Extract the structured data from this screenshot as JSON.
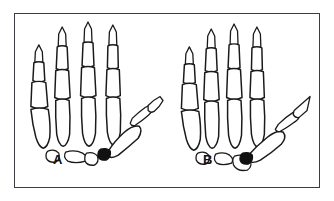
{
  "figure": {
    "kind": "anatomical-line-drawing",
    "background_color": "#ffffff",
    "line_color": "#1a1a1a",
    "frame_color": "#3c3c42",
    "marker_color": "#111111"
  },
  "panels": [
    {
      "id": "A",
      "label": "A",
      "position": "left",
      "thumb_state": "adducted",
      "joint_marker": "filled-cmc-joint",
      "bone_groups": [
        "distal-phalanges",
        "middle-phalanges",
        "proximal-phalanges",
        "metacarpals",
        "carpals",
        "thumb-metacarpal",
        "thumb-proximal-phalanx",
        "thumb-distal-phalanx"
      ],
      "digit_count": 5,
      "carpal_count": 3
    },
    {
      "id": "B",
      "label": "B",
      "position": "right",
      "thumb_state": "abducted-extended",
      "joint_marker": "filled-cmc-joint",
      "bone_groups": [
        "distal-phalanges",
        "middle-phalanges",
        "proximal-phalanges",
        "metacarpals",
        "carpals",
        "thumb-metacarpal",
        "thumb-proximal-phalanx",
        "thumb-distal-phalanx"
      ],
      "digit_count": 5,
      "carpal_count": 3
    }
  ]
}
